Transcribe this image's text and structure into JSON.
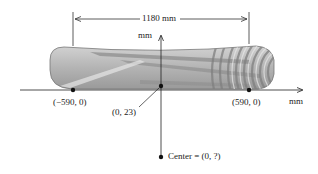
{
  "diagram": {
    "width_label": "1180 mm",
    "y_axis_label": "mm",
    "x_axis_label": "mm",
    "points": [
      {
        "id": "left-end",
        "label": "(−590, 0)"
      },
      {
        "id": "top-center",
        "label": "(0, 23)"
      },
      {
        "id": "right-end",
        "label": "(590, 0)"
      },
      {
        "id": "center",
        "label": "Center = (0, ?)"
      }
    ],
    "colors": {
      "line": "#222222",
      "board_light": "#c8c8c8",
      "board_dark": "#8a8a8a",
      "board_stripe": "#a9a9a9"
    }
  }
}
